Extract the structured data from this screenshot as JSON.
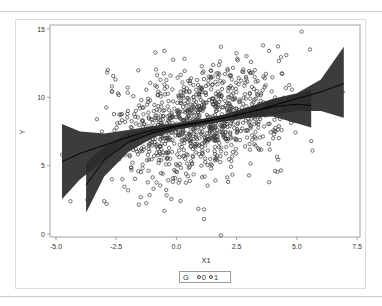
{
  "chart_data": {
    "type": "scatter",
    "title": "",
    "xlabel": "X1",
    "ylabel": "Y",
    "xlim": [
      -5.0,
      7.5
    ],
    "ylim": [
      0,
      15
    ],
    "x_ticks": [
      "-5.0",
      "-2.5",
      "0.0",
      "2.5",
      "5.0",
      "7.5"
    ],
    "x_tick_values": [
      -5.0,
      -2.5,
      0.0,
      2.5,
      5.0,
      7.5
    ],
    "y_ticks": [
      "0",
      "5",
      "10",
      "15"
    ],
    "y_tick_values": [
      0,
      5,
      10,
      15
    ],
    "grid": false,
    "legend": {
      "title": "G",
      "position": "bottom-center",
      "entries": [
        {
          "label": "0",
          "marker": "circle"
        },
        {
          "label": "1",
          "marker": "circle"
        }
      ]
    },
    "scatter_cloud": {
      "n_points": 1000,
      "x_mean": 0.9,
      "x_sd": 1.9,
      "y_intercept": 7.9,
      "y_slope": 0.33,
      "y_sd": 2.0,
      "seed": 7
    },
    "outliers": [
      [
        -4.75,
        5.8
      ],
      [
        -4.4,
        2.4
      ],
      [
        -3.7,
        2.5
      ],
      [
        -3.3,
        8.4
      ],
      [
        -3.1,
        7.5
      ],
      [
        -3.0,
        2.4
      ],
      [
        -2.9,
        2.2
      ],
      [
        -2.85,
        12.0
      ],
      [
        -0.5,
        13.4
      ],
      [
        1.85,
        -0.1
      ],
      [
        1.15,
        1.1
      ],
      [
        1.15,
        1.8
      ],
      [
        -0.5,
        1.7
      ],
      [
        5.2,
        14.8
      ],
      [
        5.55,
        13.5
      ],
      [
        5.6,
        6.8
      ],
      [
        5.65,
        6.1
      ],
      [
        6.9,
        10.4
      ],
      [
        3.6,
        13.8
      ],
      [
        4.1,
        4.6
      ]
    ],
    "series": [
      {
        "name": "G=0 fit with confidence band",
        "x": [
          -4.75,
          -4.0,
          -3.0,
          -2.0,
          -1.0,
          0.0,
          1.0,
          2.0,
          3.0,
          4.0,
          5.0,
          6.0,
          6.95
        ],
        "fit": [
          5.3,
          5.9,
          6.5,
          7.1,
          7.6,
          7.9,
          8.2,
          8.5,
          8.9,
          9.4,
          9.9,
          10.4,
          11.0
        ],
        "upper": [
          8.05,
          7.5,
          7.35,
          7.6,
          7.9,
          8.1,
          8.4,
          8.75,
          9.3,
          9.9,
          10.3,
          11.3,
          13.7
        ],
        "lower": [
          2.55,
          4.0,
          5.4,
          6.6,
          7.3,
          7.65,
          7.95,
          8.25,
          8.5,
          8.7,
          9.0,
          9.0,
          8.5
        ]
      },
      {
        "name": "G=1 fit with confidence band",
        "x": [
          -3.75,
          -3.0,
          -2.0,
          -1.0,
          0.0,
          1.0,
          2.0,
          3.0,
          4.0,
          5.0,
          5.6
        ],
        "fit": [
          3.6,
          5.4,
          6.7,
          7.4,
          7.85,
          8.15,
          8.5,
          8.9,
          9.3,
          9.5,
          9.4
        ],
        "upper": [
          5.2,
          6.4,
          7.4,
          7.8,
          8.05,
          8.35,
          8.75,
          9.25,
          9.8,
          10.2,
          10.6
        ],
        "lower": [
          1.55,
          4.2,
          6.0,
          7.0,
          7.65,
          7.95,
          8.25,
          8.5,
          8.6,
          8.1,
          7.8
        ]
      }
    ]
  },
  "legend": {
    "title": "G",
    "items": [
      "0",
      "1"
    ]
  },
  "colors": {
    "band_fill": "#2b2b2b",
    "fit_line": "#111111",
    "marker_stroke": "#3a3a3a",
    "axis": "#8a8a8a"
  }
}
